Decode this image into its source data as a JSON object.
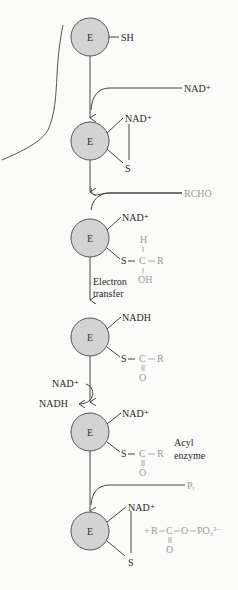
{
  "diagram": {
    "enzyme_label": "E",
    "colors": {
      "enzyme_fill": "#d3d3d3",
      "enzyme_stroke": "#555555",
      "line": "#444444",
      "substrate_text": "#9a9a9a",
      "text": "#2a2a2a"
    },
    "states": [
      {
        "id": "free-enzyme",
        "enzyme": "E",
        "group": "SH"
      },
      {
        "id": "nad-bound",
        "enzyme": "E",
        "cofactor": "NAD⁺",
        "group": "S"
      },
      {
        "id": "thiohemiacetal",
        "enzyme": "E",
        "cofactor": "NAD⁺",
        "group": "S",
        "substituent": {
          "top": "H",
          "center": "C",
          "right": "R",
          "bottom": "OH"
        }
      },
      {
        "id": "thioester-nadh",
        "enzyme": "E",
        "cofactor": "NADH",
        "group": "S",
        "substituent": {
          "center": "C",
          "right": "R",
          "bottom": "O"
        }
      },
      {
        "id": "acyl-enzyme",
        "enzyme": "E",
        "cofactor": "NAD⁺",
        "group": "S",
        "substituent": {
          "center": "C",
          "right": "R",
          "bottom": "O"
        }
      },
      {
        "id": "regenerated",
        "enzyme": "E",
        "cofactor": "NAD⁺",
        "group": "S"
      }
    ],
    "inputs": {
      "nad": "NAD⁺",
      "rcho": "RCHO",
      "pi": "Pᵢ"
    },
    "labels": {
      "electron_transfer_1": "Electron",
      "electron_transfer_2": "transfer",
      "exchange_in": "NAD⁺",
      "exchange_out": "NADH",
      "acyl_1": "Acyl",
      "acyl_2": "enzyme"
    },
    "product": {
      "plus": "+",
      "r": "R",
      "c": "C",
      "o1": "O",
      "po3": "PO₃²⁻",
      "carbonyl_o": "O"
    }
  }
}
